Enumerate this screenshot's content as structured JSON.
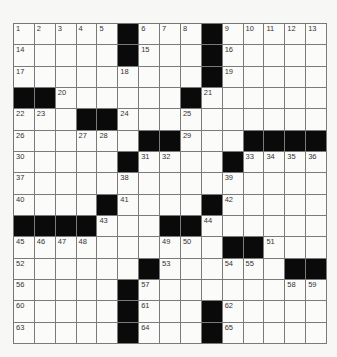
{
  "puzzle": {
    "size": {
      "rows": 15,
      "cols": 15
    },
    "colors": {
      "black_cell": "#0a0a0a",
      "white_cell": "#fbfbfa",
      "grid_line": "#7a7a7a"
    },
    "grid": [
      [
        "1",
        "2",
        "3",
        "4",
        "5",
        "#",
        "6",
        "7",
        "8",
        "#",
        "9",
        "10",
        "11",
        "12",
        "13"
      ],
      [
        "14",
        "",
        "",
        "",
        "",
        "#",
        "15",
        "",
        "",
        "#",
        "16",
        "",
        "",
        "",
        ""
      ],
      [
        "17",
        "",
        "",
        "",
        "",
        "18",
        "",
        "",
        "",
        "#",
        "19",
        "",
        "",
        "",
        ""
      ],
      [
        "#",
        "#",
        "20",
        "",
        "",
        "",
        "",
        "",
        "#",
        "21",
        "",
        "",
        "",
        "",
        ""
      ],
      [
        "22",
        "23",
        "",
        "#",
        "#",
        "24",
        "",
        "",
        "25",
        "",
        "",
        "",
        "",
        "",
        ""
      ],
      [
        "26",
        "",
        "",
        "27",
        "28",
        "",
        "#",
        "#",
        "29",
        "",
        "",
        "#",
        "#",
        "#",
        "#"
      ],
      [
        "30",
        "",
        "",
        "",
        "",
        "#",
        "31",
        "32",
        "",
        "",
        "#",
        "33",
        "34",
        "35",
        "36"
      ],
      [
        "37",
        "",
        "",
        "",
        "",
        "38",
        "",
        "",
        "",
        "",
        "39",
        "",
        "",
        "",
        ""
      ],
      [
        "40",
        "",
        "",
        "",
        "#",
        "41",
        "",
        "",
        "",
        "#",
        "42",
        "",
        "",
        "",
        ""
      ],
      [
        "#",
        "#",
        "#",
        "#",
        "43",
        "",
        "",
        "#",
        "#",
        "44",
        "",
        "",
        "",
        "",
        ""
      ],
      [
        "45",
        "46",
        "47",
        "48",
        "",
        "",
        "",
        "49",
        "50",
        "",
        "#",
        "#",
        "51",
        "",
        ""
      ],
      [
        "52",
        "",
        "",
        "",
        "",
        "",
        "#",
        "53",
        "",
        "",
        "54",
        "55",
        "",
        "#",
        "#"
      ],
      [
        "56",
        "",
        "",
        "",
        "",
        "#",
        "57",
        "",
        "",
        "",
        "",
        "",
        "",
        "58",
        "59"
      ],
      [
        "60",
        "",
        "",
        "",
        "",
        "#",
        "61",
        "",
        "",
        "#",
        "62",
        "",
        "",
        "",
        ""
      ],
      [
        "63",
        "",
        "",
        "",
        "",
        "#",
        "64",
        "",
        "",
        "#",
        "65",
        "",
        "",
        "",
        ""
      ]
    ]
  }
}
